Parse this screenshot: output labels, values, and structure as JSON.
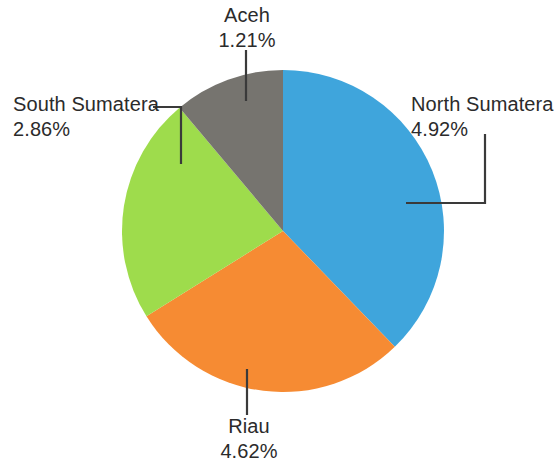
{
  "chart_data": {
    "type": "pie",
    "title": "",
    "subtitle": "",
    "xlabel": "",
    "ylabel": "",
    "legend_position": "none",
    "grid": false,
    "labels_format": "name + percent",
    "categories": [
      "North Sumatera",
      "Riau",
      "South Sumatera",
      "Aceh"
    ],
    "values": [
      4.92,
      4.62,
      2.86,
      1.21
    ],
    "value_unit": "%",
    "colors": [
      "#3FA5DC",
      "#F68B33",
      "#9EDC4C",
      "#76746F"
    ],
    "slices": [
      {
        "name": "North Sumatera",
        "value": 4.92,
        "value_text": "4.92%",
        "color": "#3FA5DC",
        "start_angle_deg": 0,
        "end_angle_deg": 136
      },
      {
        "name": "Riau",
        "value": 4.62,
        "value_text": "4.62%",
        "color": "#F68B33",
        "start_angle_deg": 136,
        "end_angle_deg": 238
      },
      {
        "name": "South Sumatera",
        "value": 2.86,
        "value_text": "2.86%",
        "color": "#9EDC4C",
        "start_angle_deg": 238,
        "end_angle_deg": 320
      },
      {
        "name": "Aceh",
        "value": 1.21,
        "value_text": "1.21%",
        "color": "#76746F",
        "start_angle_deg": 320,
        "end_angle_deg": 360
      }
    ]
  },
  "labels": {
    "aceh": {
      "name": "Aceh",
      "value": "1.21%"
    },
    "north_sumatera": {
      "name": "North Sumatera",
      "value": "4.92%"
    },
    "south_sumatera": {
      "name": "South Sumatera",
      "value": "2.86%"
    },
    "riau": {
      "name": "Riau",
      "value": "4.62%"
    }
  },
  "style": {
    "background": "#ffffff",
    "text_color": "#2b2b2b",
    "leader_color": "#3a3a3a"
  }
}
